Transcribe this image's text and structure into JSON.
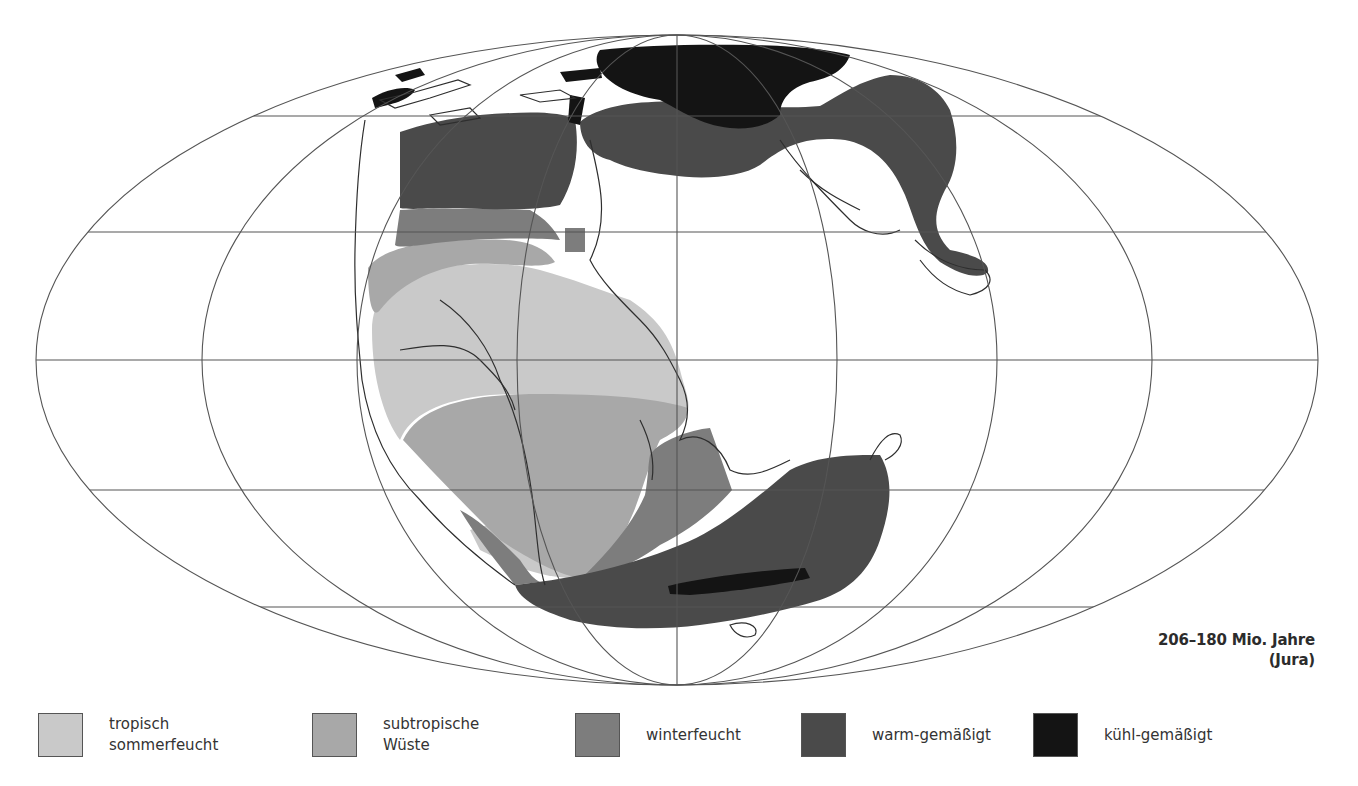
{
  "map": {
    "title_period": "206–180 Mio. Jahre",
    "title_era": "(Jura)",
    "projection": "elliptical (Mollweide-type) world graticule",
    "colors": {
      "tropisch_sommerfeucht": "#c9c9c9",
      "subtropische_wueste": "#a8a8a8",
      "winterfeucht": "#7d7d7d",
      "warm_gemaessigt": "#4a4a4a",
      "kuehl_gemaessigt": "#141414",
      "graticule": "#555555",
      "coastline": "#2e2e2e"
    }
  },
  "legend": {
    "items": [
      {
        "label": "tropisch\nsommerfeucht",
        "color": "#c9c9c9"
      },
      {
        "label": "subtropische\nWüste",
        "color": "#a8a8a8"
      },
      {
        "label": "winterfeucht",
        "color": "#7d7d7d"
      },
      {
        "label": "warm-gemäßigt",
        "color": "#4a4a4a"
      },
      {
        "label": "kühl-gemäßigt",
        "color": "#141414"
      }
    ]
  }
}
